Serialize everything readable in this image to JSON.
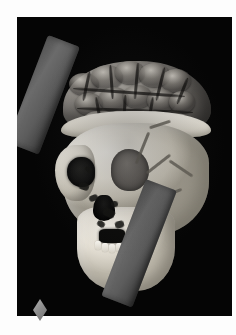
{
  "figure": {
    "title": "3D volume rendering of skull with exposed brain and penetrating rod",
    "modality": "CT volume rendering",
    "background_color": "#050505",
    "page_color": "#fdfdfd",
    "canvas": {
      "x": 17,
      "y": 17,
      "width": 215,
      "height": 299
    }
  },
  "anatomy": {
    "brain": {
      "label": "cerebral cortex",
      "color": "#8e8a84",
      "description": "exposed gyri and sulci above cut cranial vault"
    },
    "skull": {
      "label": "skull",
      "color": "#ece8de",
      "parts": [
        {
          "name": "calvaria-rim",
          "label": "cut cranial vault rim"
        },
        {
          "name": "cranial-vault",
          "label": "cranial vault"
        },
        {
          "name": "orbit-left",
          "label": "left orbit"
        },
        {
          "name": "orbit-right",
          "label": "right orbit"
        },
        {
          "name": "nasal-aperture",
          "label": "nasal aperture"
        },
        {
          "name": "zygomatic-left",
          "label": "zygomatic arch"
        },
        {
          "name": "jaw-block",
          "label": "maxilla and mandible"
        },
        {
          "name": "dental-gap",
          "label": "dental arcade"
        }
      ]
    },
    "rod": {
      "label": "penetrating tamping rod",
      "color": "#5c5c5c",
      "angle_degrees": 21,
      "segments": [
        {
          "name": "rod-upper",
          "label": "rod superior exit segment"
        },
        {
          "name": "rod-lower",
          "label": "rod inferior entry segment"
        }
      ]
    }
  },
  "markers": [
    {
      "name": "diamond-marker",
      "label": "orientation diamond marker",
      "color": "#8d8d8d",
      "shape": "diamond",
      "position": {
        "x": 33,
        "y": 299
      }
    }
  ],
  "gyri": [
    {
      "left": 14,
      "top": 16,
      "w": 30,
      "h": 22
    },
    {
      "left": 36,
      "top": 8,
      "w": 32,
      "h": 24
    },
    {
      "left": 60,
      "top": 4,
      "w": 30,
      "h": 23
    },
    {
      "left": 84,
      "top": 6,
      "w": 31,
      "h": 24
    },
    {
      "left": 106,
      "top": 12,
      "w": 30,
      "h": 23
    },
    {
      "left": 20,
      "top": 36,
      "w": 28,
      "h": 22
    },
    {
      "left": 44,
      "top": 30,
      "w": 30,
      "h": 24
    },
    {
      "left": 68,
      "top": 28,
      "w": 29,
      "h": 23
    },
    {
      "left": 92,
      "top": 32,
      "w": 29,
      "h": 23
    },
    {
      "left": 114,
      "top": 34,
      "w": 26,
      "h": 22
    },
    {
      "left": 28,
      "top": 54,
      "w": 28,
      "h": 20
    },
    {
      "left": 54,
      "top": 52,
      "w": 29,
      "h": 21
    },
    {
      "left": 80,
      "top": 52,
      "w": 28,
      "h": 21
    },
    {
      "left": 104,
      "top": 54,
      "w": 28,
      "h": 20
    }
  ],
  "sulci": [
    {
      "left": 30,
      "top": 14,
      "w": 3,
      "h": 30,
      "rot": 12
    },
    {
      "left": 55,
      "top": 8,
      "w": 3,
      "h": 34,
      "rot": -4
    },
    {
      "left": 80,
      "top": 6,
      "w": 3,
      "h": 36,
      "rot": 5
    },
    {
      "left": 104,
      "top": 10,
      "w": 3,
      "h": 34,
      "rot": 14
    },
    {
      "left": 126,
      "top": 20,
      "w": 3,
      "h": 28,
      "rot": 22
    },
    {
      "left": 18,
      "top": 34,
      "w": 112,
      "h": 3,
      "rot": 4
    },
    {
      "left": 22,
      "top": 52,
      "w": 116,
      "h": 3,
      "rot": 2
    },
    {
      "left": 42,
      "top": 40,
      "w": 3,
      "h": 28,
      "rot": -10
    },
    {
      "left": 68,
      "top": 38,
      "w": 3,
      "h": 30,
      "rot": 3
    },
    {
      "left": 94,
      "top": 40,
      "w": 3,
      "h": 28,
      "rot": 10
    }
  ],
  "sutures": [
    {
      "left": 96,
      "top": 22,
      "w": 3,
      "h": 34,
      "rot": 22
    },
    {
      "left": 112,
      "top": 40,
      "w": 3,
      "h": 30,
      "rot": 52
    },
    {
      "left": 122,
      "top": 58,
      "w": 28,
      "h": 3,
      "rot": 34
    },
    {
      "left": 104,
      "top": 14,
      "w": 22,
      "h": 3,
      "rot": -18
    },
    {
      "left": 126,
      "top": 74,
      "w": 3,
      "h": 20,
      "rot": 68
    }
  ],
  "fissures": [
    {
      "left": 34,
      "top": 74,
      "w": 10,
      "h": 7,
      "rot": 18
    },
    {
      "left": 44,
      "top": 86,
      "w": 9,
      "h": 6,
      "rot": -22
    },
    {
      "left": 58,
      "top": 100,
      "w": 12,
      "h": 8,
      "rot": 26
    },
    {
      "left": 70,
      "top": 112,
      "w": 9,
      "h": 7,
      "rot": -14
    },
    {
      "left": 52,
      "top": 112,
      "w": 8,
      "h": 6,
      "rot": 34
    },
    {
      "left": 66,
      "top": 92,
      "w": 7,
      "h": 6,
      "rot": 8
    },
    {
      "left": 84,
      "top": 132,
      "w": 8,
      "h": 6,
      "rot": -28
    },
    {
      "left": 40,
      "top": 58,
      "w": 7,
      "h": 5,
      "rot": 44
    }
  ],
  "teeth": [
    {
      "left": 50,
      "top": 132
    },
    {
      "left": 57,
      "top": 134
    },
    {
      "left": 64,
      "top": 135
    },
    {
      "left": 71,
      "top": 134
    },
    {
      "left": 78,
      "top": 132
    },
    {
      "left": 85,
      "top": 129
    }
  ]
}
